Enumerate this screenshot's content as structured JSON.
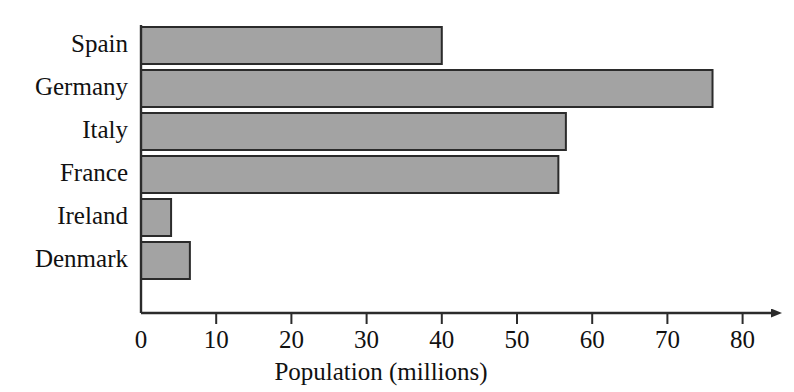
{
  "chart_data": {
    "type": "bar",
    "orientation": "horizontal",
    "title": "",
    "xlabel": "Population (millions)",
    "ylabel": "",
    "categories": [
      "Spain",
      "Germany",
      "Italy",
      "France",
      "Ireland",
      "Denmark"
    ],
    "values": [
      40,
      76,
      56.5,
      55.5,
      4,
      6.5
    ],
    "xlim": [
      0,
      80
    ],
    "xticks": [
      0,
      10,
      20,
      30,
      40,
      50,
      60,
      70,
      80
    ],
    "xtick_labels": [
      "0",
      "10",
      "20",
      "30",
      "40",
      "50",
      "60",
      "70",
      "80"
    ],
    "grid": false,
    "legend": null,
    "bar_fill_color": "#a3a3a3",
    "bar_edge_color": "#2b2b2b",
    "axis_color": "#2b2b2b",
    "background_color": "#ffffff",
    "axis_arrow": true
  }
}
